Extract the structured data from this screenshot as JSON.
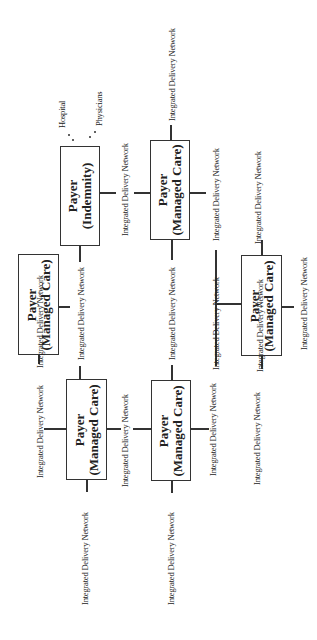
{
  "diagram": {
    "boxes": [
      {
        "id": "indemnity",
        "title": "Payer",
        "subtitle": "(Indemnity)"
      },
      {
        "id": "mc-top-right",
        "title": "Payer",
        "subtitle": "(Managed Care)"
      },
      {
        "id": "mc-left-mid",
        "title": "Payer",
        "subtitle": "(Managed Care)"
      },
      {
        "id": "mc-right-mid",
        "title": "Payer",
        "subtitle": "(Managed Care)"
      },
      {
        "id": "mc-bottom-left",
        "title": "Payer",
        "subtitle": "(Managed Care)"
      },
      {
        "id": "mc-bottom-mid",
        "title": "Payer",
        "subtitle": "(Managed Care)"
      }
    ],
    "network_label": "Integrated Delivery Network",
    "hospital": "Hospital",
    "physicians": "Physicians"
  }
}
